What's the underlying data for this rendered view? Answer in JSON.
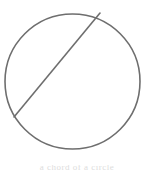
{
  "figure": {
    "background_color": "#ffffff",
    "stroke_color": "#6e6e6e",
    "stroke_width": 1.6,
    "caption": {
      "text": "a chord of a circle",
      "color": "#dddddd",
      "visible": "cropped"
    }
  },
  "chart_data": {
    "type": "scatter",
    "xlabel": "",
    "ylabel": "",
    "xlim": [
      0,
      154
    ],
    "ylim": [
      174,
      0
    ],
    "grid": false,
    "legend": "none",
    "shapes": [
      {
        "name": "circle",
        "type": "circle",
        "cx": 72.5,
        "cy": 81.5,
        "r": 67.5,
        "fill": "none",
        "stroke": "#6e6e6e",
        "stroke_width": 1.6
      },
      {
        "name": "chord",
        "type": "line",
        "x1": 100,
        "y1": 13,
        "x2": 14,
        "y2": 117,
        "stroke": "#6e6e6e",
        "stroke_width": 1.6
      }
    ],
    "annotations": []
  }
}
